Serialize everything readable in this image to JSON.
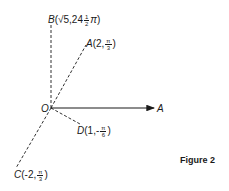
{
  "diagram": {
    "origin": {
      "label": "O",
      "x": 51,
      "y": 108
    },
    "axis": {
      "label": "A",
      "end_x": 155,
      "end_y": 108
    },
    "points": [
      {
        "id": "B",
        "name": "B",
        "r": "√5",
        "theta_whole": "24",
        "theta_num": "1",
        "theta_den": "2",
        "theta_suffix": "π",
        "x": 51,
        "y": 24
      },
      {
        "id": "A",
        "name": "A",
        "r": "2",
        "theta_num": "π",
        "theta_den": "3",
        "x": 86,
        "y": 44
      },
      {
        "id": "D",
        "name": "D",
        "r": "1",
        "sign": "-",
        "theta_num": "π",
        "theta_den": "6",
        "x": 80,
        "y": 124
      },
      {
        "id": "C",
        "name": "C",
        "r": "-2",
        "theta_num": "π",
        "theta_den": "3",
        "x": 16,
        "y": 168
      }
    ],
    "caption": "Figure 2",
    "colors": {
      "ink": "#1a1a1a",
      "background": "#ffffff"
    }
  }
}
